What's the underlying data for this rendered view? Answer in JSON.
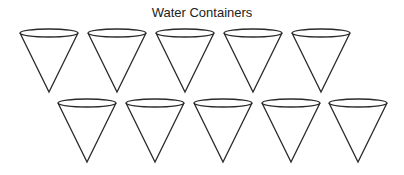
{
  "title": "Water Containers",
  "stroke_color": "#2a2a2a",
  "cone": {
    "rx": 29,
    "ry": 4,
    "height": 59
  },
  "rows": [
    {
      "name": "top-row",
      "cy": 33,
      "centers": [
        49,
        117,
        185,
        253,
        321
      ]
    },
    {
      "name": "bottom-row",
      "cy": 103,
      "centers": [
        87,
        155,
        223,
        291,
        358
      ]
    }
  ]
}
